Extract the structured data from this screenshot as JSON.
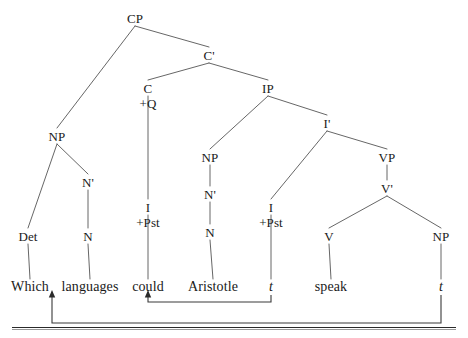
{
  "diagram": {
    "type": "syntax-tree",
    "sentence": "Which languages could Aristotle t speak t",
    "line_color": "#555555",
    "text_color": "#1a1a1a",
    "arrow_color": "#3a3a3a",
    "nodes": [
      {
        "id": "cp",
        "label": "CP",
        "x": 135,
        "y": 18,
        "kind": "cat"
      },
      {
        "id": "cbar",
        "label": "C'",
        "x": 209,
        "y": 55,
        "kind": "cat"
      },
      {
        "id": "c",
        "label": "C",
        "x": 148,
        "y": 88,
        "kind": "cat"
      },
      {
        "id": "cq",
        "label": "+Q",
        "x": 148,
        "y": 103,
        "kind": "feat"
      },
      {
        "id": "ip",
        "label": "IP",
        "x": 268,
        "y": 88,
        "kind": "cat"
      },
      {
        "id": "np_wh",
        "label": "NP",
        "x": 57,
        "y": 136,
        "kind": "cat"
      },
      {
        "id": "ibar",
        "label": "I'",
        "x": 327,
        "y": 123,
        "kind": "cat"
      },
      {
        "id": "nbar_wh",
        "label": "N'",
        "x": 88,
        "y": 182,
        "kind": "cat"
      },
      {
        "id": "np_subj",
        "label": "NP",
        "x": 210,
        "y": 157,
        "kind": "cat"
      },
      {
        "id": "vp",
        "label": "VP",
        "x": 387,
        "y": 157,
        "kind": "cat"
      },
      {
        "id": "nbar_subj",
        "label": "N'",
        "x": 210,
        "y": 194,
        "kind": "cat"
      },
      {
        "id": "vbar",
        "label": "V'",
        "x": 387,
        "y": 188,
        "kind": "cat"
      },
      {
        "id": "det",
        "label": "Det",
        "x": 28,
        "y": 236,
        "kind": "cat"
      },
      {
        "id": "n_wh",
        "label": "N",
        "x": 88,
        "y": 236,
        "kind": "cat"
      },
      {
        "id": "i_c",
        "label": "I",
        "x": 148,
        "y": 207,
        "kind": "cat"
      },
      {
        "id": "i_c_pst",
        "label": "+Pst",
        "x": 148,
        "y": 222,
        "kind": "feat"
      },
      {
        "id": "n_subj",
        "label": "N",
        "x": 210,
        "y": 232,
        "kind": "cat"
      },
      {
        "id": "i_ip",
        "label": "I",
        "x": 271,
        "y": 207,
        "kind": "cat"
      },
      {
        "id": "i_ip_pst",
        "label": "+Pst",
        "x": 271,
        "y": 222,
        "kind": "feat"
      },
      {
        "id": "v",
        "label": "V",
        "x": 329,
        "y": 236,
        "kind": "cat"
      },
      {
        "id": "np_obj",
        "label": "NP",
        "x": 441,
        "y": 236,
        "kind": "cat"
      },
      {
        "id": "w_which",
        "label": "Which",
        "x": 30,
        "y": 287,
        "kind": "word"
      },
      {
        "id": "w_langs",
        "label": "languages",
        "x": 90,
        "y": 287,
        "kind": "word"
      },
      {
        "id": "w_could",
        "label": "could",
        "x": 148,
        "y": 287,
        "kind": "word"
      },
      {
        "id": "w_arist",
        "label": "Aristotle",
        "x": 213,
        "y": 287,
        "kind": "word"
      },
      {
        "id": "w_t1",
        "label": "t",
        "x": 271,
        "y": 287,
        "kind": "trace"
      },
      {
        "id": "w_speak",
        "label": "speak",
        "x": 331,
        "y": 287,
        "kind": "word"
      },
      {
        "id": "w_t2",
        "label": "t",
        "x": 441,
        "y": 287,
        "kind": "trace"
      }
    ],
    "edges": [
      {
        "from": "cp",
        "to": "np_wh"
      },
      {
        "from": "cp",
        "to": "cbar"
      },
      {
        "from": "cbar",
        "to": "c"
      },
      {
        "from": "cbar",
        "to": "ip"
      },
      {
        "from": "c",
        "to": "i_c"
      },
      {
        "from": "ip",
        "to": "np_subj"
      },
      {
        "from": "ip",
        "to": "ibar"
      },
      {
        "from": "np_wh",
        "to": "det"
      },
      {
        "from": "np_wh",
        "to": "nbar_wh"
      },
      {
        "from": "nbar_wh",
        "to": "n_wh"
      },
      {
        "from": "np_subj",
        "to": "nbar_subj"
      },
      {
        "from": "nbar_subj",
        "to": "n_subj"
      },
      {
        "from": "ibar",
        "to": "i_ip"
      },
      {
        "from": "ibar",
        "to": "vp"
      },
      {
        "from": "vp",
        "to": "vbar"
      },
      {
        "from": "vbar",
        "to": "v"
      },
      {
        "from": "vbar",
        "to": "np_obj"
      },
      {
        "from": "det",
        "to": "w_which"
      },
      {
        "from": "n_wh",
        "to": "w_langs"
      },
      {
        "from": "i_c",
        "to": "w_could"
      },
      {
        "from": "n_subj",
        "to": "w_arist"
      },
      {
        "from": "i_ip",
        "to": "w_t1"
      },
      {
        "from": "v",
        "to": "w_speak"
      },
      {
        "from": "np_obj",
        "to": "w_t2"
      }
    ],
    "movement_arrows": [
      {
        "id": "head-movement",
        "from_label": "t",
        "to_label": "could",
        "from_x": 271,
        "to_x": 148,
        "depth_y": 302,
        "top_y": 295
      },
      {
        "id": "wh-movement",
        "from_label": "t",
        "to_label": "languages",
        "from_x": 441,
        "to_x": 52,
        "depth_y": 323,
        "top_y": 295
      }
    ]
  }
}
